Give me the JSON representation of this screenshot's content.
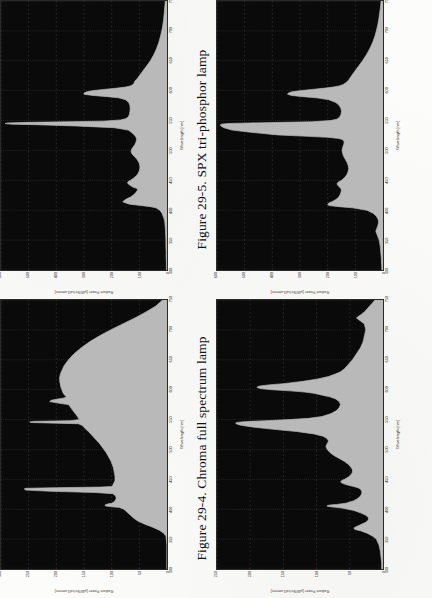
{
  "page": {
    "background_color": "#fcfcfb",
    "orientation": "rotated-90-ccw",
    "scan_note": "book page scan, two figures"
  },
  "figures": [
    {
      "id": "fig-29-5",
      "caption": "Figure 29-5. SPX tri-phosphor lamp",
      "position": "upper-left-quadrant",
      "chart_data": {
        "type": "area",
        "title": "SPX tri-phosphor lamp",
        "xlabel": "Wavelength [nm]",
        "ylabel": "Radiant Power [µW/Str/cd/Lumens]",
        "xlim": [
          300,
          750
        ],
        "ylim": [
          0,
          600
        ],
        "xticks": [
          300,
          350,
          400,
          450,
          500,
          550,
          600,
          650,
          700,
          750
        ],
        "yticks": [
          0,
          100,
          200,
          300,
          400,
          500,
          600
        ],
        "grid": true,
        "plot_bg": "#0a0a0a",
        "trace_color": "#b9b9b9",
        "x": [
          300,
          310,
          320,
          330,
          340,
          350,
          360,
          370,
          380,
          385,
          390,
          395,
          400,
          404,
          406,
          408,
          410,
          414,
          418,
          422,
          426,
          430,
          434,
          436,
          437,
          438,
          440,
          442,
          444,
          446,
          448,
          450,
          454,
          458,
          462,
          466,
          470,
          474,
          478,
          482,
          486,
          490,
          494,
          498,
          502,
          506,
          510,
          514,
          518,
          522,
          526,
          530,
          534,
          538,
          541,
          543,
          544,
          545,
          546,
          547,
          548,
          549,
          551,
          553,
          556,
          560,
          565,
          570,
          575,
          580,
          585,
          588,
          590,
          592,
          594,
          596,
          598,
          600,
          602,
          604,
          606,
          608,
          610,
          612,
          614,
          616,
          618,
          620,
          625,
          630,
          635,
          640,
          645,
          650,
          655,
          660,
          670,
          680,
          690,
          700,
          710,
          720,
          730,
          740,
          750
        ],
        "y": [
          2,
          2,
          3,
          3,
          4,
          4,
          5,
          6,
          8,
          10,
          14,
          18,
          26,
          40,
          60,
          95,
          135,
          160,
          150,
          132,
          120,
          112,
          106,
          108,
          112,
          120,
          128,
          135,
          140,
          143,
          140,
          132,
          120,
          110,
          104,
          100,
          98,
          98,
          100,
          104,
          110,
          118,
          126,
          130,
          128,
          122,
          116,
          112,
          110,
          112,
          118,
          128,
          140,
          190,
          330,
          470,
          560,
          585,
          575,
          500,
          360,
          230,
          168,
          150,
          140,
          136,
          134,
          133,
          134,
          138,
          150,
          175,
          215,
          268,
          300,
          300,
          290,
          270,
          230,
          185,
          150,
          132,
          124,
          120,
          118,
          116,
          112,
          108,
          100,
          92,
          84,
          76,
          68,
          60,
          54,
          48,
          38,
          30,
          24,
          19,
          15,
          12,
          10,
          8,
          6
        ]
      }
    },
    {
      "id": "fig-29-4",
      "caption": "Figure 29-4. Chroma full spectrum lamp",
      "position": "lower-left-quadrant",
      "chart_data": {
        "type": "area",
        "title": "Chroma full spectrum lamp",
        "xlabel": "Wavelength [nm]",
        "ylabel": "Radiant Power [µW/Str/cd/Lumens]",
        "xlim": [
          300,
          750
        ],
        "ylim": [
          0,
          300
        ],
        "xticks": [
          300,
          350,
          400,
          450,
          500,
          550,
          600,
          650,
          700,
          750
        ],
        "yticks": [
          0,
          50,
          100,
          150,
          200,
          250,
          300
        ],
        "grid": true,
        "plot_bg": "#0a0a0a",
        "trace_color": "#b9b9b9",
        "x": [
          300,
          320,
          340,
          355,
          360,
          365,
          370,
          375,
          380,
          385,
          390,
          395,
          400,
          403,
          404,
          405,
          406,
          407,
          408,
          409,
          410,
          412,
          414,
          416,
          418,
          420,
          422,
          424,
          426,
          428,
          430,
          432,
          434,
          435,
          436,
          437,
          438,
          440,
          442,
          444,
          446,
          448,
          450,
          455,
          460,
          465,
          470,
          475,
          480,
          485,
          490,
          495,
          500,
          505,
          510,
          515,
          520,
          525,
          530,
          535,
          540,
          543,
          544,
          545,
          546,
          547,
          548,
          550,
          552,
          555,
          558,
          560,
          565,
          570,
          575,
          578,
          580,
          582,
          584,
          586,
          588,
          590,
          592,
          595,
          600,
          605,
          610,
          615,
          620,
          625,
          630,
          640,
          650,
          660,
          670,
          680,
          690,
          700,
          710,
          720,
          730,
          740,
          750
        ],
        "y": [
          0,
          0,
          0,
          2,
          6,
          14,
          26,
          40,
          52,
          60,
          66,
          72,
          78,
          86,
          100,
          108,
          112,
          112,
          110,
          106,
          100,
          96,
          94,
          93,
          92,
          92,
          93,
          95,
          98,
          130,
          210,
          255,
          258,
          255,
          200,
          120,
          100,
          98,
          97,
          96,
          95,
          94,
          94,
          94,
          95,
          96,
          97,
          99,
          101,
          104,
          107,
          110,
          114,
          118,
          122,
          127,
          132,
          137,
          142,
          148,
          153,
          160,
          200,
          245,
          248,
          240,
          175,
          158,
          160,
          162,
          164,
          166,
          170,
          174,
          178,
          200,
          212,
          210,
          200,
          186,
          182,
          184,
          186,
          188,
          190,
          192,
          193,
          194,
          194,
          193,
          191,
          186,
          178,
          168,
          155,
          140,
          122,
          102,
          80,
          58,
          38,
          20,
          8
        ]
      }
    },
    {
      "id": "fig-top-right",
      "caption": "",
      "position": "upper-right-quadrant",
      "chart_data": {
        "type": "area",
        "title": "",
        "xlabel": "Wavelength [nm]",
        "ylabel": "Radiant Power [µW/Str/cd/Lumens]",
        "xlim": [
          300,
          750
        ],
        "ylim": [
          0,
          600
        ],
        "xticks": [
          300,
          350,
          400,
          450,
          500,
          550,
          600,
          650,
          700,
          750
        ],
        "yticks": [
          0,
          100,
          200,
          300,
          400,
          500,
          600
        ],
        "grid": true,
        "plot_bg": "#0a0a0a",
        "trace_color": "#b9b9b9",
        "x": [
          300,
          310,
          320,
          330,
          340,
          350,
          355,
          360,
          365,
          370,
          375,
          380,
          385,
          390,
          395,
          400,
          404,
          406,
          408,
          410,
          412,
          414,
          418,
          422,
          426,
          430,
          434,
          436,
          438,
          440,
          442,
          444,
          446,
          448,
          450,
          455,
          460,
          465,
          470,
          475,
          480,
          485,
          490,
          495,
          500,
          505,
          510,
          514,
          518,
          520,
          522,
          524,
          526,
          530,
          534,
          538,
          541,
          543,
          544,
          545,
          546,
          547,
          548,
          550,
          552,
          555,
          560,
          565,
          570,
          575,
          580,
          585,
          588,
          590,
          592,
          594,
          596,
          598,
          600,
          602,
          604,
          606,
          608,
          610,
          614,
          618,
          622,
          626,
          630,
          635,
          640,
          650,
          660,
          670,
          680,
          690,
          700,
          710,
          720,
          730,
          740,
          750
        ],
        "y": [
          4,
          5,
          6,
          8,
          10,
          14,
          18,
          22,
          26,
          22,
          18,
          16,
          18,
          24,
          36,
          58,
          110,
          160,
          196,
          200,
          196,
          185,
          170,
          160,
          155,
          152,
          150,
          152,
          156,
          160,
          164,
          166,
          164,
          158,
          150,
          138,
          130,
          126,
          124,
          126,
          130,
          136,
          142,
          146,
          148,
          146,
          142,
          140,
          145,
          160,
          200,
          290,
          380,
          470,
          545,
          575,
          586,
          588,
          584,
          560,
          480,
          360,
          255,
          190,
          168,
          158,
          152,
          150,
          152,
          158,
          170,
          196,
          240,
          290,
          330,
          345,
          342,
          330,
          300,
          258,
          215,
          180,
          158,
          145,
          132,
          124,
          118,
          112,
          106,
          98,
          90,
          74,
          60,
          48,
          38,
          30,
          24,
          19,
          15,
          12,
          9,
          7
        ]
      }
    },
    {
      "id": "fig-bottom-right",
      "caption": "",
      "position": "lower-right-quadrant",
      "chart_data": {
        "type": "area",
        "title": "",
        "xlabel": "Wavelength [nm]",
        "ylabel": "Radiant Power [µW/Str/cd/Lumens]",
        "xlim": [
          300,
          750
        ],
        "ylim": [
          0,
          250
        ],
        "xticks": [
          300,
          350,
          400,
          450,
          500,
          550,
          600,
          650,
          700,
          750
        ],
        "yticks": [
          0,
          50,
          100,
          150,
          200,
          250
        ],
        "grid": true,
        "plot_bg": "#0a0a0a",
        "trace_color": "#b9b9b9",
        "x": [
          300,
          310,
          320,
          330,
          340,
          350,
          355,
          360,
          364,
          366,
          368,
          370,
          374,
          378,
          382,
          386,
          390,
          394,
          398,
          402,
          404,
          405,
          406,
          407,
          408,
          410,
          414,
          418,
          422,
          426,
          430,
          434,
          436,
          438,
          440,
          442,
          444,
          446,
          448,
          450,
          454,
          458,
          462,
          466,
          470,
          475,
          480,
          485,
          490,
          495,
          500,
          505,
          510,
          514,
          518,
          522,
          526,
          530,
          534,
          538,
          541,
          543,
          544,
          545,
          546,
          547,
          548,
          550,
          552,
          555,
          560,
          565,
          570,
          575,
          580,
          585,
          588,
          590,
          592,
          594,
          596,
          598,
          600,
          602,
          604,
          606,
          608,
          610,
          614,
          618,
          622,
          626,
          630,
          635,
          640,
          650,
          660,
          670,
          680,
          690,
          700,
          710,
          715,
          720,
          725,
          730,
          735,
          740,
          745,
          750
        ],
        "y": [
          2,
          2,
          3,
          4,
          6,
          10,
          16,
          24,
          34,
          42,
          44,
          42,
          34,
          26,
          22,
          22,
          26,
          34,
          44,
          62,
          78,
          84,
          84,
          80,
          70,
          56,
          44,
          38,
          34,
          32,
          32,
          34,
          38,
          44,
          52,
          58,
          62,
          64,
          62,
          58,
          52,
          48,
          46,
          46,
          48,
          52,
          58,
          66,
          74,
          80,
          84,
          86,
          84,
          82,
          84,
          90,
          104,
          130,
          168,
          200,
          216,
          221,
          222,
          220,
          214,
          200,
          178,
          140,
          112,
          92,
          78,
          70,
          66,
          64,
          66,
          72,
          80,
          88,
          96,
          104,
          118,
          140,
          168,
          185,
          190,
          186,
          172,
          150,
          120,
          98,
          82,
          72,
          64,
          58,
          54,
          46,
          40,
          34,
          30,
          28,
          26,
          28,
          34,
          40,
          34,
          28,
          24,
          20,
          16,
          12
        ]
      }
    }
  ],
  "axis_text": {
    "xlabel": "Wavelength [nm]",
    "ylabel": "Radiant Power [µW/Str/cd/Lumens]"
  }
}
